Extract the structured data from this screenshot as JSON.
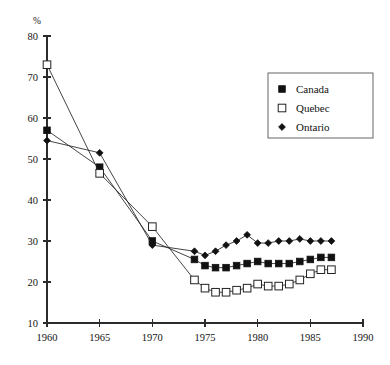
{
  "chart_data": {
    "type": "line",
    "title": "",
    "subtitle": "",
    "xlabel": "",
    "ylabel": "%",
    "ylabel_position": "top-left",
    "xlim": [
      1960,
      1990
    ],
    "ylim": [
      10,
      80
    ],
    "x_ticks": [
      1960,
      1965,
      1970,
      1975,
      1980,
      1985,
      1990
    ],
    "y_ticks": [
      10,
      20,
      30,
      40,
      50,
      60,
      70,
      80
    ],
    "grid": false,
    "legend_position": "top-right",
    "series": [
      {
        "name": "Canada",
        "marker": "filled-square",
        "x": [
          1960,
          1965,
          1970,
          1974,
          1975,
          1976,
          1977,
          1978,
          1979,
          1980,
          1981,
          1982,
          1983,
          1984,
          1985,
          1986,
          1987
        ],
        "values": [
          57.0,
          48.0,
          30.0,
          25.5,
          24.0,
          23.5,
          23.5,
          24.0,
          24.5,
          25.0,
          24.5,
          24.5,
          24.5,
          25.0,
          25.5,
          26.0,
          26.0
        ]
      },
      {
        "name": "Quebec",
        "marker": "open-square",
        "x": [
          1960,
          1965,
          1970,
          1974,
          1975,
          1976,
          1977,
          1978,
          1979,
          1980,
          1981,
          1982,
          1983,
          1984,
          1985,
          1986,
          1987
        ],
        "values": [
          73.0,
          46.5,
          33.5,
          20.5,
          18.5,
          17.5,
          17.5,
          18.0,
          18.5,
          19.5,
          19.0,
          19.0,
          19.5,
          20.5,
          22.0,
          23.0,
          23.0
        ]
      },
      {
        "name": "Ontario",
        "marker": "diamond",
        "x": [
          1960,
          1965,
          1970,
          1974,
          1975,
          1976,
          1977,
          1978,
          1979,
          1980,
          1981,
          1982,
          1983,
          1984,
          1985,
          1986,
          1987
        ],
        "values": [
          54.5,
          51.5,
          29.0,
          27.5,
          26.5,
          27.5,
          29.0,
          30.0,
          31.5,
          29.5,
          29.5,
          30.0,
          30.0,
          30.5,
          30.0,
          30.0,
          30.0
        ]
      }
    ],
    "legend": [
      {
        "label": "Canada",
        "marker": "filled-square"
      },
      {
        "label": "Quebec",
        "marker": "open-square"
      },
      {
        "label": "Ontario",
        "marker": "diamond"
      }
    ]
  }
}
